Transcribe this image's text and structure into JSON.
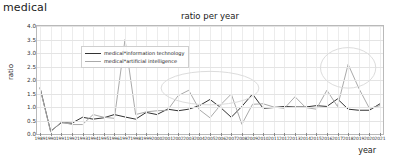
{
  "page": {
    "header": "medical"
  },
  "chart_data": {
    "type": "line",
    "title": "ratio per year",
    "xlabel": "year",
    "ylabel": "ratio",
    "grid": true,
    "legend_position": "upper-left",
    "ylim": [
      0.0,
      4.0
    ],
    "yticks": [
      "0.0",
      "0.5",
      "1.0",
      "1.5",
      "2.0",
      "2.5",
      "3.0",
      "3.5",
      "4.0"
    ],
    "ytick_values": [
      0.0,
      0.5,
      1.0,
      1.5,
      2.0,
      2.5,
      3.0,
      3.5,
      4.0
    ],
    "categories": [
      "1989",
      "1990",
      "1991",
      "1992",
      "1993",
      "1994",
      "1995",
      "1996",
      "1997",
      "1998",
      "1999",
      "2000",
      "2001",
      "2002",
      "2003",
      "2004",
      "2005",
      "2006",
      "2007",
      "2008",
      "2009",
      "2010",
      "2011",
      "2012",
      "2013",
      "2014",
      "2015",
      "2016",
      "2017",
      "2018",
      "2019",
      "2020",
      "2021"
    ],
    "series": [
      {
        "name": "medical*information technology",
        "color": "#333333",
        "values": [
          1.72,
          0.1,
          0.42,
          0.4,
          0.62,
          0.55,
          0.6,
          0.72,
          0.63,
          0.55,
          0.8,
          0.72,
          0.92,
          0.86,
          0.92,
          1.05,
          1.28,
          0.98,
          0.62,
          1.02,
          1.48,
          0.95,
          0.98,
          1.02,
          1.0,
          1.0,
          1.05,
          1.02,
          1.3,
          0.92,
          0.88,
          0.88,
          1.12
        ]
      },
      {
        "name": "medical*artificial intelligence",
        "color": "#aaaaaa",
        "values": [
          1.7,
          0.08,
          0.45,
          0.35,
          0.35,
          0.72,
          0.62,
          0.58,
          3.5,
          0.72,
          0.82,
          0.86,
          0.88,
          1.42,
          1.62,
          0.9,
          0.6,
          1.08,
          1.48,
          0.36,
          1.1,
          1.12,
          1.0,
          0.95,
          1.38,
          0.98,
          0.92,
          1.62,
          1.02,
          2.58,
          1.7,
          0.95,
          1.05
        ]
      }
    ],
    "annotations": [
      {
        "type": "ellipse",
        "label": "highlight-mid",
        "cx_category": "2005",
        "cy_value": 1.7,
        "rx_years": 4.6,
        "ry_value": 0.62
      },
      {
        "type": "ellipse",
        "label": "highlight-right",
        "cx_category": "2018",
        "cy_value": 2.45,
        "rx_years": 2.6,
        "ry_value": 0.75
      }
    ]
  }
}
